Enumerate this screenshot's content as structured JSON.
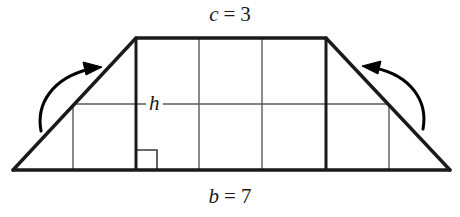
{
  "figure": {
    "type": "geometry-diagram",
    "labels": {
      "top_var": "c",
      "top_eq": "=",
      "top_value": "3",
      "top_full": "c = 3",
      "bottom_var": "b",
      "bottom_eq": "=",
      "bottom_value": "7",
      "bottom_full": "b = 7",
      "height_var": "h"
    },
    "colors": {
      "outline": "#1a1a1a",
      "grid": "#5a5a5a",
      "background": "#ffffff",
      "arrow": "#000000"
    },
    "geometry": {
      "base_left_x": 13,
      "base_right_x": 450,
      "base_y": 170,
      "top_left_x": 136,
      "top_right_x": 326,
      "top_y": 38,
      "mid_line_y": 104,
      "mid_line_left_x": 73,
      "mid_line_right_x": 389,
      "grid_vertical_x": [
        73,
        136,
        199,
        262,
        326,
        389
      ],
      "right_angle_marker": {
        "x": 137,
        "y": 150,
        "size": 20
      },
      "unit_columns": 7,
      "unit_rows": 2
    },
    "arrows": [
      {
        "name": "left-fold-arrow",
        "direction": "clockwise-up-right",
        "start": [
          41,
          131
        ],
        "end": [
          100,
          69
        ]
      },
      {
        "name": "right-fold-arrow",
        "direction": "counterclockwise-up-left",
        "start": [
          423,
          129
        ],
        "end": [
          364,
          68
        ]
      }
    ]
  }
}
